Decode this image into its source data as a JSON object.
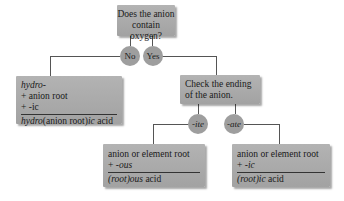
{
  "question_box": {
    "line1": "Does the anion",
    "line2": "contain oxygen?"
  },
  "branch_no": {
    "label": "No"
  },
  "branch_yes": {
    "label": "Yes"
  },
  "no_oxygen_box": {
    "line1_prefix": "hydro-",
    "line2": "+ anion root",
    "line3": "+ -ic",
    "result_prefix": "hydro",
    "result_middle": "(anion root)",
    "result_suffix": "ic",
    "result_tail": " acid"
  },
  "check_box": {
    "line1": "Check the ending",
    "line2": "of the anion."
  },
  "branch_ite": {
    "label": "-ite"
  },
  "branch_ate": {
    "label": "-ate"
  },
  "ite_box": {
    "line1": "anion or element root",
    "line2_prefix": "+ ",
    "line2_suffix": "-ous",
    "result_root": "(root)",
    "result_suffix": "ous",
    "result_tail": " acid"
  },
  "ate_box": {
    "line1": "anion or element root",
    "line2_prefix": "+ ",
    "line2_suffix": "-ic",
    "result_root": "(root)",
    "result_suffix": "ic",
    "result_tail": " acid"
  },
  "colors": {
    "box": "#aaaaaa",
    "circle": "#9e9e9e",
    "line": "#555555"
  }
}
